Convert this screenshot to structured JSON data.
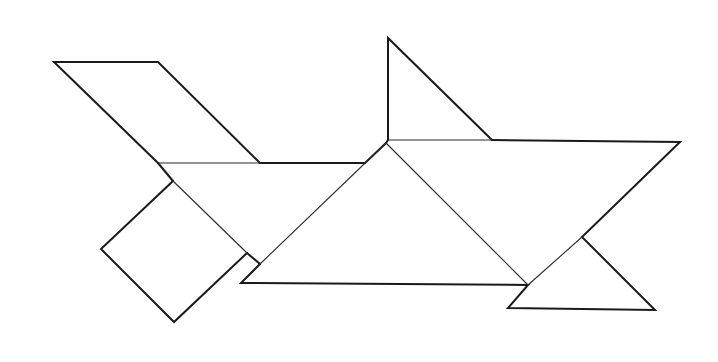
{
  "figure": {
    "type": "tangram",
    "stroke_color": "#1a1a1a",
    "background": "#ffffff",
    "pieces": [
      {
        "name": "parallelogram",
        "points": [
          [
            54,
            62
          ],
          [
            158,
            62
          ],
          [
            260,
            163
          ],
          [
            158,
            163
          ]
        ]
      },
      {
        "name": "square",
        "points": [
          [
            173,
            181
          ],
          [
            101,
            249
          ],
          [
            174,
            322
          ],
          [
            247,
            253
          ]
        ]
      },
      {
        "name": "medium-triangle-left",
        "points": [
          [
            158,
            163
          ],
          [
            365,
            163
          ],
          [
            260,
            264
          ]
        ]
      },
      {
        "name": "large-triangle-center",
        "points": [
          [
            386,
            143
          ],
          [
            241,
            283
          ],
          [
            528,
            285
          ]
        ]
      },
      {
        "name": "small-triangle-top",
        "points": [
          [
            388,
            38
          ],
          [
            388,
            140
          ],
          [
            492,
            140
          ]
        ]
      },
      {
        "name": "large-triangle-right",
        "points": [
          [
            386,
            141
          ],
          [
            680,
            142
          ],
          [
            528,
            285
          ]
        ]
      },
      {
        "name": "small-triangle-bottom",
        "points": [
          [
            508,
            308
          ],
          [
            655,
            310
          ],
          [
            582,
            237
          ]
        ]
      }
    ]
  }
}
